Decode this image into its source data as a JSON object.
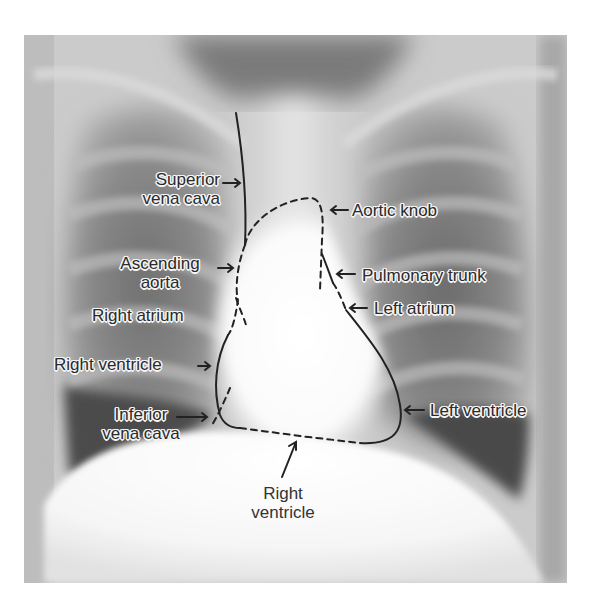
{
  "figure": {
    "type": "annotated chest radiograph (PA view)",
    "colors": {
      "background": "#ffffff",
      "xray_dark": "#3a3a3a",
      "xray_mid": "#9a9a9a",
      "xray_light": "#f2f2f2",
      "outline": "#222222",
      "label_text": "#2a2a2a",
      "label_halo": "#f4f4f4"
    }
  },
  "labels": {
    "superior_vena_cava": {
      "line1": "Superior",
      "line2": "vena cava"
    },
    "ascending_aorta": {
      "line1": "Ascending",
      "line2": "aorta"
    },
    "right_atrium": {
      "text": "Right atrium"
    },
    "right_ventricle_left": {
      "text": "Right ventricle"
    },
    "inferior_vena_cava": {
      "line1": "Inferior",
      "line2": "vena cava"
    },
    "aortic_knob": {
      "text": "Aortic knob"
    },
    "pulmonary_trunk": {
      "text": "Pulmonary trunk"
    },
    "left_atrium": {
      "text": "Left atrium"
    },
    "left_ventricle": {
      "text": "Left ventricle"
    },
    "right_ventricle_bottom": {
      "line1": "Right",
      "line2": "ventricle"
    }
  },
  "arrows": {
    "superior_vena_cava": "→",
    "ascending_aorta": "→",
    "right_ventricle_left": "→",
    "inferior_vena_cava": "→",
    "aortic_knob": "←",
    "pulmonary_trunk": "←",
    "left_atrium": "←",
    "left_ventricle": "←",
    "right_ventricle_bottom": "↑"
  }
}
